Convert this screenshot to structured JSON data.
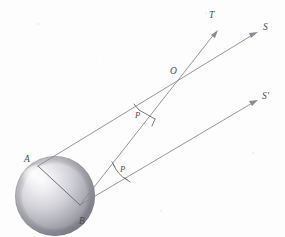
{
  "figure": {
    "background_color": "#fdfdfd",
    "line_color": "#8a8a92",
    "label_color": "#4a4a52",
    "width": 285,
    "height": 237
  },
  "labels": {
    "point_a": "A",
    "point_b": "B",
    "point_o": "O",
    "ray_t": "T",
    "ray_s": "S",
    "ray_s_prime": "S'",
    "angle_upper": "P",
    "angle_lower": "P"
  },
  "geometry": {
    "sphere": {
      "center_x": 55,
      "center_y": 196,
      "radius": 40,
      "highlight_x": 40,
      "highlight_y": 180
    },
    "points": {
      "A": {
        "x": 38,
        "y": 166
      },
      "B": {
        "x": 80,
        "y": 205
      },
      "O": {
        "x": 181,
        "y": 81
      }
    },
    "rays": [
      {
        "name": "A-to-S",
        "from": "A",
        "to_x": 258,
        "to_y": 32,
        "label": "S"
      },
      {
        "name": "B-to-T",
        "from": "B",
        "to_x": 218,
        "to_y": 30,
        "label": "T"
      },
      {
        "name": "B-to-S-prime",
        "from": "B",
        "to_x": 258,
        "to_y": 101,
        "label": "S'"
      }
    ],
    "angles": [
      {
        "name": "upper-P",
        "label": "P",
        "x": 140,
        "y": 114
      },
      {
        "name": "lower-P",
        "label": "P",
        "x": 119,
        "y": 172
      }
    ]
  }
}
